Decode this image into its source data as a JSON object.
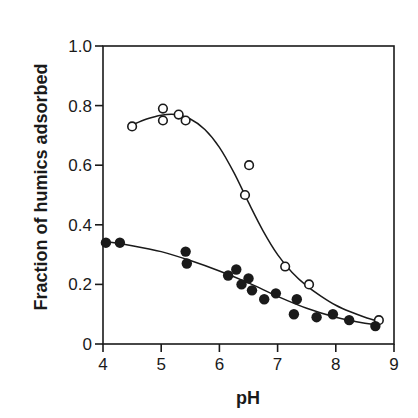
{
  "chart_data": {
    "type": "scatter",
    "title": "",
    "xlabel": "pH",
    "ylabel": "Fraction of humics adsorbed",
    "xlim": [
      4,
      9
    ],
    "ylim": [
      0,
      1.0
    ],
    "xticks": [
      4,
      5,
      6,
      7,
      8,
      9
    ],
    "xtick_labels": [
      "4",
      "5",
      "6",
      "7",
      "8",
      "9"
    ],
    "yticks": [
      0,
      0.2,
      0.4,
      0.6,
      0.8,
      1.0
    ],
    "ytick_labels": [
      "0",
      "0.2",
      "0.4",
      "0.6",
      "0.8",
      "1.0"
    ],
    "grid": false,
    "legend": null,
    "series": [
      {
        "name": "open circles",
        "marker": "open-circle",
        "points": [
          [
            4.5,
            0.73
          ],
          [
            5.03,
            0.79
          ],
          [
            5.03,
            0.75
          ],
          [
            5.3,
            0.77
          ],
          [
            5.42,
            0.75
          ],
          [
            6.44,
            0.5
          ],
          [
            6.51,
            0.6
          ],
          [
            7.13,
            0.26
          ],
          [
            7.54,
            0.2
          ],
          [
            8.74,
            0.08
          ]
        ],
        "fit_curve": [
          [
            4.5,
            0.735
          ],
          [
            4.75,
            0.755
          ],
          [
            5.0,
            0.768
          ],
          [
            5.25,
            0.77
          ],
          [
            5.5,
            0.755
          ],
          [
            5.75,
            0.72
          ],
          [
            6.0,
            0.66
          ],
          [
            6.25,
            0.575
          ],
          [
            6.5,
            0.475
          ],
          [
            6.75,
            0.38
          ],
          [
            7.0,
            0.3
          ],
          [
            7.25,
            0.24
          ],
          [
            7.5,
            0.195
          ],
          [
            7.75,
            0.16
          ],
          [
            8.0,
            0.13
          ],
          [
            8.25,
            0.108
          ],
          [
            8.5,
            0.09
          ],
          [
            8.75,
            0.075
          ]
        ]
      },
      {
        "name": "filled circles",
        "marker": "filled-circle",
        "points": [
          [
            4.05,
            0.34
          ],
          [
            4.29,
            0.34
          ],
          [
            5.42,
            0.31
          ],
          [
            5.44,
            0.27
          ],
          [
            6.15,
            0.23
          ],
          [
            6.29,
            0.25
          ],
          [
            6.38,
            0.2
          ],
          [
            6.5,
            0.22
          ],
          [
            6.56,
            0.18
          ],
          [
            6.77,
            0.15
          ],
          [
            6.97,
            0.17
          ],
          [
            7.33,
            0.15
          ],
          [
            7.28,
            0.1
          ],
          [
            7.67,
            0.09
          ],
          [
            7.95,
            0.1
          ],
          [
            8.23,
            0.08
          ],
          [
            8.68,
            0.06
          ]
        ],
        "fit_curve": [
          [
            4.0,
            0.345
          ],
          [
            4.5,
            0.33
          ],
          [
            5.0,
            0.31
          ],
          [
            5.5,
            0.28
          ],
          [
            6.0,
            0.245
          ],
          [
            6.5,
            0.205
          ],
          [
            7.0,
            0.16
          ],
          [
            7.5,
            0.12
          ],
          [
            8.0,
            0.09
          ],
          [
            8.5,
            0.07
          ],
          [
            8.75,
            0.065
          ]
        ]
      }
    ]
  }
}
